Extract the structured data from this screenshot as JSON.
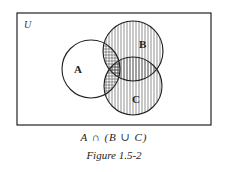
{
  "diagram": {
    "universe_label": "U",
    "sets": [
      {
        "label": "A",
        "cx": 91,
        "cy": 69,
        "r": 29
      },
      {
        "label": "B",
        "cx": 133,
        "cy": 51,
        "r": 30
      },
      {
        "label": "C",
        "cx": 133,
        "cy": 86,
        "r": 29
      }
    ],
    "shading": {
      "vertical_hatch": "B ∪ C",
      "cross_hatch": "A ∩ (B ∪ C)"
    },
    "stroke_color": "#222222"
  },
  "caption": {
    "expression": "A ∩ (B ∪ C)",
    "figure_label": "Figure 1.5-2"
  }
}
